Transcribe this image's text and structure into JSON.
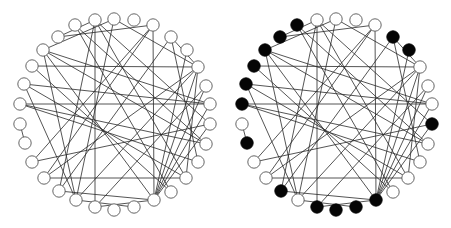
{
  "figure": {
    "width": 451,
    "height": 228,
    "node_radius": 6.2,
    "colors": {
      "edge": "#2a2a2a",
      "node_stroke": "#555555",
      "node_fill_hollow": "#ffffff",
      "node_fill_marked": "#050505"
    }
  },
  "graphs": [
    {
      "name": "left-graph",
      "offset_x": 0,
      "nodes": [
        [
          114,
          19
        ],
        [
          134,
          20
        ],
        [
          153,
          25
        ],
        [
          171,
          37
        ],
        [
          187,
          50
        ],
        [
          198,
          67
        ],
        [
          206,
          86
        ],
        [
          210,
          104
        ],
        [
          210,
          124
        ],
        [
          206,
          144
        ],
        [
          198,
          162
        ],
        [
          186,
          178
        ],
        [
          171,
          192
        ],
        [
          154,
          200
        ],
        [
          134,
          207
        ],
        [
          114,
          210
        ],
        [
          95,
          207
        ],
        [
          76,
          200
        ],
        [
          59,
          191
        ],
        [
          44,
          178
        ],
        [
          32,
          162
        ],
        [
          25,
          143
        ],
        [
          20,
          124
        ],
        [
          20,
          104
        ],
        [
          24,
          84
        ],
        [
          32,
          66
        ],
        [
          43,
          50
        ],
        [
          58,
          37
        ],
        [
          75,
          25
        ],
        [
          95,
          20
        ]
      ],
      "marked": []
    },
    {
      "name": "right-graph",
      "offset_x": 222,
      "nodes": [
        [
          114,
          19
        ],
        [
          134,
          20
        ],
        [
          153,
          25
        ],
        [
          171,
          37
        ],
        [
          187,
          50
        ],
        [
          198,
          67
        ],
        [
          206,
          86
        ],
        [
          210,
          104
        ],
        [
          210,
          124
        ],
        [
          206,
          144
        ],
        [
          198,
          162
        ],
        [
          186,
          178
        ],
        [
          171,
          192
        ],
        [
          154,
          200
        ],
        [
          134,
          207
        ],
        [
          114,
          210
        ],
        [
          95,
          207
        ],
        [
          76,
          200
        ],
        [
          59,
          191
        ],
        [
          44,
          178
        ],
        [
          32,
          162
        ],
        [
          25,
          143
        ],
        [
          20,
          124
        ],
        [
          20,
          104
        ],
        [
          24,
          84
        ],
        [
          32,
          66
        ],
        [
          43,
          50
        ],
        [
          58,
          37
        ],
        [
          75,
          25
        ],
        [
          95,
          20
        ]
      ],
      "marked": [
        3,
        4,
        8,
        13,
        14,
        15,
        16,
        18,
        21,
        23,
        24,
        25,
        26,
        27,
        28
      ]
    }
  ],
  "edges": [
    [
      29,
      16
    ],
    [
      2,
      13
    ],
    [
      25,
      5
    ],
    [
      23,
      7
    ],
    [
      0,
      26
    ],
    [
      0,
      17
    ],
    [
      0,
      5
    ],
    [
      29,
      27
    ],
    [
      29,
      18
    ],
    [
      29,
      11
    ],
    [
      29,
      8
    ],
    [
      2,
      27
    ],
    [
      2,
      19
    ],
    [
      2,
      20
    ],
    [
      3,
      10
    ],
    [
      3,
      5
    ],
    [
      26,
      7
    ],
    [
      26,
      13
    ],
    [
      26,
      9
    ],
    [
      26,
      17
    ],
    [
      5,
      17
    ],
    [
      5,
      19
    ],
    [
      5,
      13
    ],
    [
      5,
      11
    ],
    [
      7,
      13
    ],
    [
      7,
      24
    ],
    [
      24,
      17
    ],
    [
      24,
      11
    ],
    [
      23,
      10
    ],
    [
      23,
      9
    ],
    [
      22,
      21
    ],
    [
      20,
      8
    ],
    [
      19,
      11
    ],
    [
      18,
      13
    ],
    [
      18,
      3
    ],
    [
      17,
      14
    ],
    [
      16,
      13
    ],
    [
      16,
      6
    ],
    [
      13,
      8
    ],
    [
      13,
      6
    ],
    [
      13,
      4
    ],
    [
      12,
      25
    ],
    [
      12,
      28
    ],
    [
      9,
      28
    ]
  ]
}
